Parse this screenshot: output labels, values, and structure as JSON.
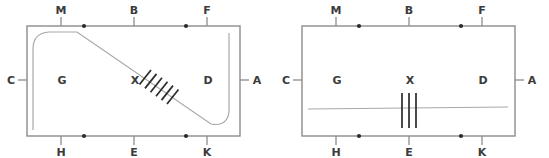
{
  "figure": {
    "title": "",
    "background_color": "#ffffff",
    "line_color": "#8c8c8c",
    "hatch_color": "#2b2b2b",
    "label_color": "#3b3b3b",
    "dot_color": "#2b2b2b"
  },
  "panels": [
    {
      "id": "left",
      "name": "left-diagram",
      "boundary_labels": {
        "top": [
          "M",
          "B",
          "F"
        ],
        "bottom": [
          "H",
          "E",
          "K"
        ],
        "left": [
          "C"
        ],
        "right": [
          "A"
        ]
      },
      "region_labels": [
        "G",
        "X",
        "D"
      ],
      "edge_dots_top": 2,
      "edge_dots_bottom": 2,
      "hatch_count": 6,
      "hatch_orientation": "perpendicular-to-diagonal",
      "interior_path": "rounded-diagonal"
    },
    {
      "id": "right",
      "name": "right-diagram",
      "boundary_labels": {
        "top": [
          "M",
          "B",
          "F"
        ],
        "bottom": [
          "H",
          "E",
          "K"
        ],
        "left": [
          "C"
        ],
        "right": [
          "A"
        ]
      },
      "region_labels": [
        "G",
        "X",
        "D"
      ],
      "edge_dots_top": 2,
      "edge_dots_bottom": 2,
      "hatch_count": 3,
      "hatch_orientation": "vertical",
      "interior_path": "horizontal-line"
    }
  ],
  "labels": {
    "M": "M",
    "B": "B",
    "F": "F",
    "C": "C",
    "A": "A",
    "G": "G",
    "X": "X",
    "D": "D",
    "H": "H",
    "E": "E",
    "K": "K"
  }
}
